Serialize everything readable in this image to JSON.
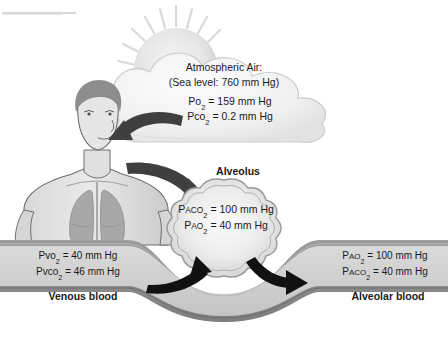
{
  "figure": {
    "type": "physiology-diagram"
  },
  "atmosphere": {
    "heading": "Atmospheric Air:",
    "sea_level": "(Sea level: 760 mm Hg)",
    "po2": {
      "label": "Po",
      "sub": "2",
      "value": "= 159 mm Hg"
    },
    "pco2": {
      "label": "Pco",
      "sub": "2",
      "value": "= 0.2 mm Hg"
    }
  },
  "alveolus": {
    "label": "Alveolus",
    "paco2": {
      "label": "P",
      "small": "ACO",
      "sub": "2",
      "value": "= 100 mm Hg"
    },
    "pao2": {
      "label": "P",
      "small": "AO",
      "sub": "2",
      "value": "= 40 mm Hg"
    }
  },
  "venous_blood": {
    "label": "Venous blood",
    "pvo2": {
      "label": "Pvo",
      "sub": "2",
      "value": "= 40 mm Hg"
    },
    "pvco2": {
      "label": "Pvco",
      "sub": "2",
      "value": "= 46 mm Hg"
    }
  },
  "alveolar_blood": {
    "label": "Alveolar blood",
    "pao2": {
      "label": "P",
      "small": "AO",
      "sub": "2",
      "value": "= 100 mm Hg"
    },
    "paco2": {
      "label": "P",
      "small": "ACO",
      "sub": "2",
      "value": "= 40 mm Hg"
    }
  },
  "icons": {
    "sun": "sun-icon",
    "cloud": "cloud-icon",
    "human": "human-torso-icon",
    "lungs": "lungs-icon",
    "arrow_air_to_nose": "curved-arrow-icon",
    "arrow_lung_to_alveolus": "curved-arrow-icon",
    "arrow_blood_to_alveolus": "curved-arrow-icon",
    "arrow_alveolus_to_blood": "curved-arrow-icon"
  },
  "colors": {
    "background": "#ffffff",
    "text": "#1a1a1a",
    "cloud_fill": "#efefef",
    "cloud_stroke": "#cfcfcf",
    "sun_fill": "#e4e4e4",
    "skin_fill": "#e2e2e2",
    "skin_stroke": "#6e6e6e",
    "lung_fill": "#a8a8a8",
    "hair_fill": "#8d8d8d",
    "arrow_dark": "#3a3a3a",
    "arrow_black": "#111111",
    "vessel_wall": "#8e8e8e",
    "vessel_lumen": "#d2d2d2",
    "alveolus_fill": "#e6e6e6",
    "alveolus_stroke": "#9a9a9a"
  }
}
